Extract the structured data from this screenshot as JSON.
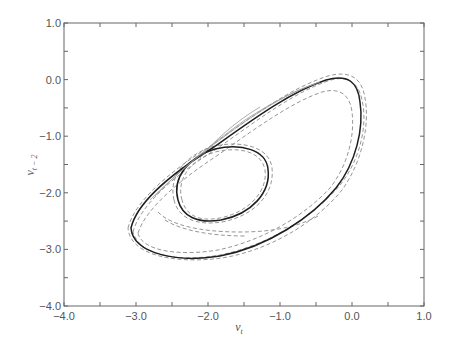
{
  "chart_data": {
    "type": "line",
    "title": "",
    "xlabel": "v_t",
    "xlabel_main": "v",
    "xlabel_sub": "t",
    "ylabel": "v_{t-2}",
    "ylabel_main": "v",
    "ylabel_sub": "t − 2",
    "xlim": [
      -4.0,
      1.0
    ],
    "ylim": [
      -4.0,
      1.0
    ],
    "x_ticks": [
      -4.0,
      -3.0,
      -2.0,
      -1.0,
      0.0,
      1.0
    ],
    "x_tick_labels": [
      "−4.0",
      "−3.0",
      "−2.0",
      "−1.0",
      "0.0",
      "1.0"
    ],
    "y_ticks": [
      1.0,
      0.0,
      -1.0,
      -2.0,
      -3.0,
      -4.0
    ],
    "y_tick_labels": [
      "1.0",
      "0.0",
      "−1.0",
      "−2.0",
      "−3.0",
      "−4.0"
    ],
    "minor_tick_step": 0.5,
    "grid": false,
    "legend": null,
    "series": [
      {
        "name": "solid trajectory",
        "style": "solid",
        "color": "#222222",
        "outer_loop": {
          "x": [
            -3.06,
            -2.6,
            -1.6,
            -0.6,
            0.0,
            0.04,
            -0.4,
            -1.2,
            -2.0,
            -2.7,
            -3.06
          ],
          "y": [
            -2.7,
            -3.08,
            -2.95,
            -2.3,
            -1.2,
            -0.2,
            0.0,
            -0.5,
            -1.3,
            -2.1,
            -2.7
          ]
        },
        "inner_loop": {
          "x": [
            -2.4,
            -2.05,
            -1.55,
            -1.3,
            -1.45,
            -1.9,
            -2.3,
            -2.4
          ],
          "y": [
            -2.15,
            -2.3,
            -2.2,
            -1.75,
            -1.5,
            -1.45,
            -1.65,
            -2.15
          ]
        }
      },
      {
        "name": "dashed trajectories",
        "style": "dashed",
        "color": "#777777",
        "notes": "several near-parallel dashed curves around both loops, plus one lower dashed arc near y≈-2.4 under the inner loop"
      }
    ]
  }
}
